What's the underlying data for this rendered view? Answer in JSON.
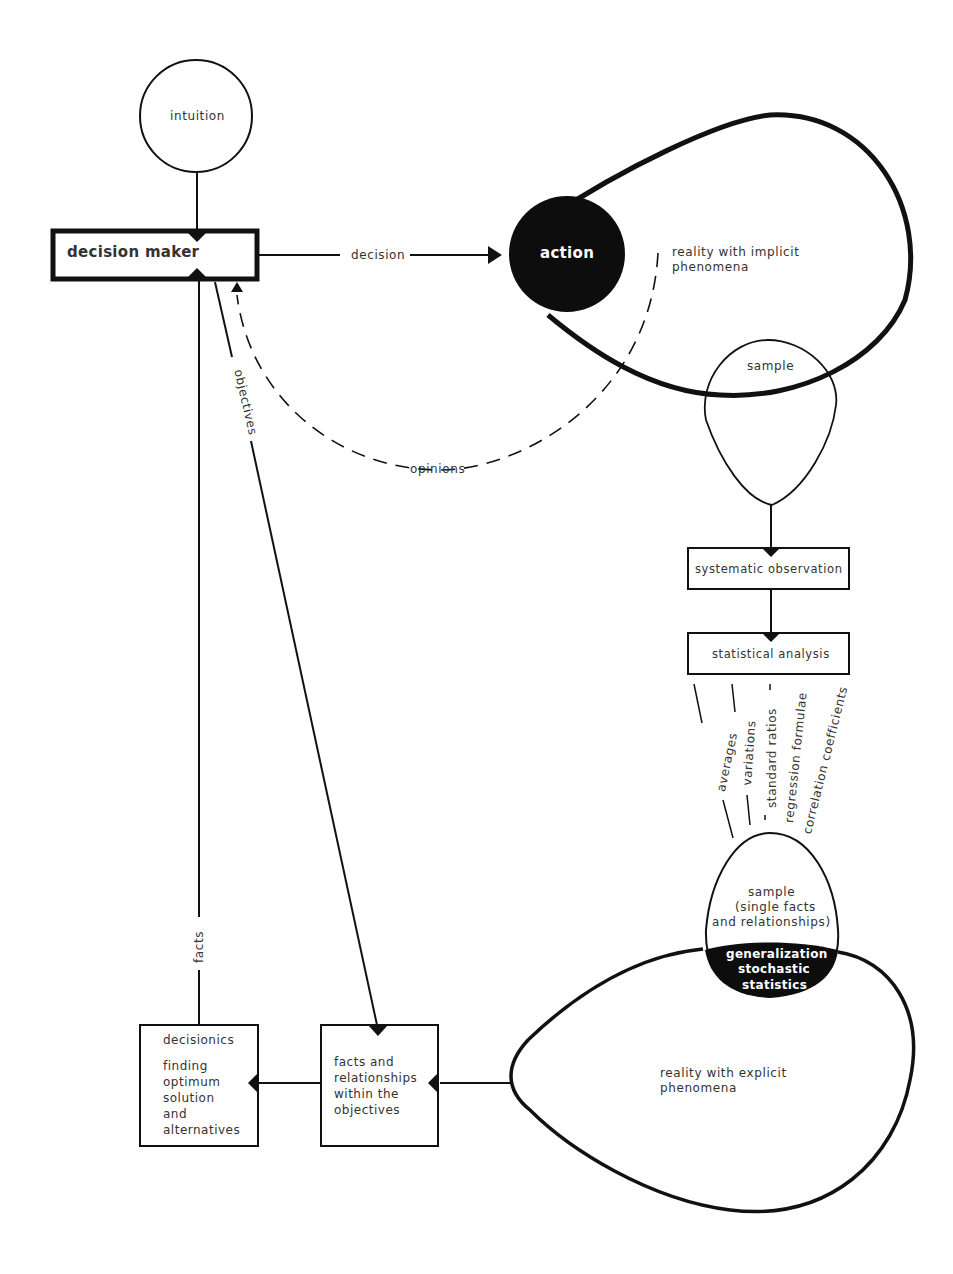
{
  "diagram": {
    "nodes": {
      "intuition": {
        "label": "intuition"
      },
      "decision_maker": {
        "label": "decision maker"
      },
      "action": {
        "label": "action"
      },
      "reality_implicit": {
        "label_line1": "reality  with  implicit",
        "label_line2": "phenomena"
      },
      "sample_top": {
        "label": "sample"
      },
      "systematic_observation": {
        "label": "systematic observation"
      },
      "statistical_analysis": {
        "label": "statistical analysis"
      },
      "sample_bottom": {
        "line1": "sample",
        "line2": "(single facts",
        "line3": "and relationships)"
      },
      "generalization": {
        "line1": "generalization",
        "line2": "stochastic",
        "line3": "statistics"
      },
      "reality_explicit": {
        "label_line1": "reality  with  explicit",
        "label_line2": "phenomena"
      },
      "facts_relationships": {
        "line1": "facts and",
        "line2": "relationships",
        "line3": "within the",
        "line4": "objectives"
      },
      "decisionics": {
        "title": "decisionics",
        "line1": "finding",
        "line2": "optimum",
        "line3": "solution",
        "line4": "and",
        "line5": "alternatives"
      }
    },
    "edges": {
      "decision": "decision",
      "opinions": "opinions",
      "objectives": "objectives",
      "facts": "facts"
    },
    "analysis_outputs": [
      "averages",
      "variations",
      "standard ratios",
      "regression formulae",
      "correlation coefficients"
    ],
    "colors": {
      "ink": "#111111",
      "paper": "#ffffff",
      "text": "#333333"
    }
  }
}
